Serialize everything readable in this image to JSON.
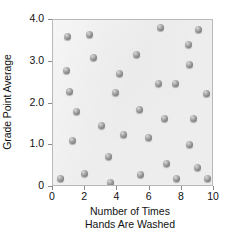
{
  "chart_data": {
    "type": "scatter",
    "title": "",
    "xlabel": "Number of Times\nHands Are Washed",
    "xlabel_line1": "Number of Times",
    "xlabel_line2": "Hands Are Washed",
    "ylabel": "Grade Point Average",
    "xlim": [
      0,
      10
    ],
    "ylim": [
      0,
      4.0
    ],
    "xticks": [
      0,
      2,
      4,
      6,
      8,
      10
    ],
    "xticklabels": [
      "0",
      "2",
      "4",
      "6",
      "8",
      "10"
    ],
    "yticks": [
      0,
      1.0,
      2.0,
      3.0,
      4.0
    ],
    "yticklabels": [
      "0",
      "1.0",
      "2.0",
      "3.0",
      "4.0"
    ],
    "grid": false,
    "legend": null,
    "marker_style": "shaded-gray-sphere",
    "plot_background": "#ededed",
    "frame_color": "#b9b9b9",
    "points": [
      {
        "x": 0.45,
        "y": 0.2
      },
      {
        "x": 0.9,
        "y": 3.61
      },
      {
        "x": 0.85,
        "y": 2.79
      },
      {
        "x": 1.05,
        "y": 2.29
      },
      {
        "x": 1.2,
        "y": 1.11
      },
      {
        "x": 1.45,
        "y": 1.81
      },
      {
        "x": 1.95,
        "y": 0.32
      },
      {
        "x": 2.25,
        "y": 3.66
      },
      {
        "x": 2.5,
        "y": 3.09
      },
      {
        "x": 3.0,
        "y": 1.47
      },
      {
        "x": 3.45,
        "y": 0.72
      },
      {
        "x": 3.55,
        "y": 0.1
      },
      {
        "x": 3.9,
        "y": 2.27
      },
      {
        "x": 4.1,
        "y": 2.71
      },
      {
        "x": 4.4,
        "y": 1.26
      },
      {
        "x": 5.2,
        "y": 3.18
      },
      {
        "x": 5.4,
        "y": 1.86
      },
      {
        "x": 5.45,
        "y": 0.3
      },
      {
        "x": 5.95,
        "y": 1.18
      },
      {
        "x": 6.55,
        "y": 2.47
      },
      {
        "x": 6.7,
        "y": 3.81
      },
      {
        "x": 6.95,
        "y": 1.65
      },
      {
        "x": 7.05,
        "y": 0.56
      },
      {
        "x": 7.6,
        "y": 2.48
      },
      {
        "x": 7.65,
        "y": 0.2
      },
      {
        "x": 8.4,
        "y": 3.42
      },
      {
        "x": 8.45,
        "y": 2.93
      },
      {
        "x": 8.5,
        "y": 1.02
      },
      {
        "x": 8.7,
        "y": 1.65
      },
      {
        "x": 8.95,
        "y": 0.47
      },
      {
        "x": 9.05,
        "y": 3.77
      },
      {
        "x": 9.55,
        "y": 2.25
      },
      {
        "x": 9.6,
        "y": 0.2
      }
    ]
  }
}
